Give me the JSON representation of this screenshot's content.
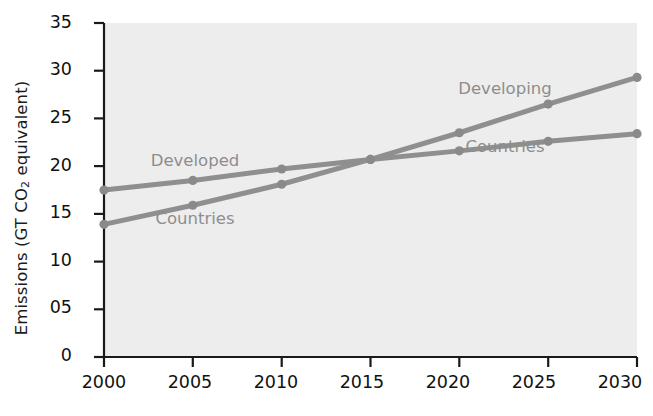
{
  "chart_data": {
    "type": "line",
    "title": "",
    "xlabel": "",
    "ylabel": "Emissions (GT CO2 equivalent)",
    "ylabel_prefix": "Emissions (GT CO",
    "ylabel_sub": "2",
    "ylabel_suffix": " equivalent)",
    "categories": [
      2000,
      2005,
      2010,
      2015,
      2020,
      2025,
      2030
    ],
    "x_tick_labels": [
      "2000",
      "2005",
      "2010",
      "2015",
      "2020",
      "2025",
      "2030"
    ],
    "y_tick_labels": [
      "35",
      "30",
      "25",
      "20",
      "15",
      "10",
      "05",
      "0"
    ],
    "y_tick_values": [
      35,
      30,
      25,
      20,
      15,
      10,
      5,
      0
    ],
    "xlim": [
      2000,
      2030
    ],
    "ylim": [
      0,
      35
    ],
    "grid": false,
    "legend_position": "inline-annotations",
    "series": [
      {
        "name": "Developed Countries",
        "values": [
          17.5,
          18.5,
          19.7,
          20.7,
          21.6,
          22.6,
          23.4
        ],
        "color": "#8f8f8f"
      },
      {
        "name": "Developing Countries",
        "values": [
          13.9,
          15.9,
          18.1,
          20.7,
          23.5,
          26.5,
          29.3
        ],
        "color": "#8f8f8f"
      }
    ],
    "annotations": [
      {
        "text": "Developed\nCountries",
        "line1": "Developed",
        "line2": "Countries",
        "x": 2002.6,
        "y": 24.2
      },
      {
        "text": "Developing\nCountries",
        "line1": "Developing",
        "line2": "Countries",
        "x": 2021.5,
        "y": 31.6
      }
    ],
    "colors": {
      "plot_background": "#ededed",
      "axis": "#1a1a1a",
      "line": "#8f8f8f",
      "marker": "#8a8a8a",
      "annotation_text": "#8d8d8d"
    }
  }
}
